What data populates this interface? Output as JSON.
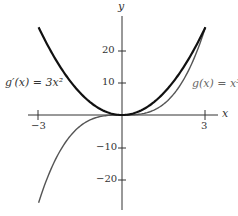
{
  "chart_data": {
    "type": "line",
    "title": "",
    "xlabel": "x",
    "ylabel": "y",
    "xlim": [
      -3.0,
      3.0
    ],
    "ylim": [
      -27,
      27
    ],
    "grid": false,
    "x_ticks": [
      "-3",
      "3"
    ],
    "y_ticks": [
      "20",
      "10",
      "-10",
      "-20"
    ],
    "series": [
      {
        "name": "g'(x) = 3x^2",
        "label": "g′(x) = 3x²",
        "color": "#111111",
        "stroke_width": 2.2,
        "x": [
          -3,
          -2.5,
          -2,
          -1.5,
          -1,
          -0.5,
          0,
          0.5,
          1,
          1.5,
          2,
          2.5,
          3
        ],
        "values": [
          27,
          18.75,
          12,
          6.75,
          3,
          0.75,
          0,
          0.75,
          3,
          6.75,
          12,
          18.75,
          27
        ]
      },
      {
        "name": "g(x) = x^3",
        "label": "g(x) = x³",
        "color": "#555555",
        "stroke_width": 1.4,
        "x": [
          -3,
          -2.5,
          -2,
          -1.5,
          -1,
          -0.5,
          0,
          0.5,
          1,
          1.5,
          2,
          2.5,
          3
        ],
        "values": [
          -27,
          -15.625,
          -8,
          -3.375,
          -1,
          -0.125,
          0,
          0.125,
          1,
          3.375,
          8,
          15.625,
          27
        ]
      }
    ]
  },
  "labels": {
    "y_axis": "y",
    "x_axis": "x",
    "tick_x_neg3": "−3",
    "tick_x_3": "3",
    "tick_y_20": "20",
    "tick_y_10": "10",
    "tick_y_neg10": "−10",
    "tick_y_neg20": "−20",
    "deriv_label": "g′(x) = 3x²",
    "func_label": "g(x) = x³"
  }
}
